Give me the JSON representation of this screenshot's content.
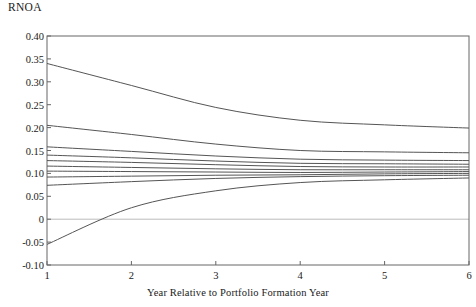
{
  "chart_data": {
    "type": "line",
    "title": "",
    "ylabel": "RNOA",
    "xlabel": "Year Relative to Portfolio Formation Year",
    "x": [
      1,
      2,
      3,
      4,
      5,
      6
    ],
    "xlim": [
      1,
      6
    ],
    "ylim": [
      -0.1,
      0.4
    ],
    "ytick_labels": [
      "0.40",
      "0.35",
      "0.30",
      "0.25",
      "0.20",
      "0.15",
      "0.10",
      "0.05",
      "0",
      "-0.05",
      "-0.10"
    ],
    "ytick_values": [
      0.4,
      0.35,
      0.3,
      0.25,
      0.2,
      0.15,
      0.1,
      0.05,
      0,
      -0.05,
      -0.1
    ],
    "xtick_labels": [
      "1",
      "2",
      "3",
      "4",
      "5",
      "6"
    ],
    "xtick_values": [
      1,
      2,
      3,
      4,
      5,
      6
    ],
    "grid": false,
    "zero_line": true,
    "legend": "none",
    "line_color": "#555555",
    "zero_line_color": "#bbbbbb",
    "axis_color": "#666666",
    "series": [
      {
        "name": "portfolio-10",
        "values": [
          0.34,
          0.292,
          0.244,
          0.216,
          0.206,
          0.199
        ]
      },
      {
        "name": "portfolio-9",
        "values": [
          0.205,
          0.185,
          0.164,
          0.15,
          0.147,
          0.145
        ]
      },
      {
        "name": "portfolio-8",
        "values": [
          0.158,
          0.148,
          0.138,
          0.131,
          0.129,
          0.128
        ]
      },
      {
        "name": "portfolio-7",
        "values": [
          0.14,
          0.134,
          0.127,
          0.122,
          0.121,
          0.12
        ]
      },
      {
        "name": "portfolio-6",
        "values": [
          0.128,
          0.124,
          0.119,
          0.115,
          0.114,
          0.114
        ]
      },
      {
        "name": "portfolio-5",
        "values": [
          0.116,
          0.113,
          0.11,
          0.108,
          0.108,
          0.108
        ]
      },
      {
        "name": "portfolio-4",
        "values": [
          0.105,
          0.104,
          0.103,
          0.102,
          0.103,
          0.104
        ]
      },
      {
        "name": "portfolio-3",
        "values": [
          0.092,
          0.094,
          0.096,
          0.097,
          0.099,
          0.1
        ]
      },
      {
        "name": "portfolio-2",
        "values": [
          0.074,
          0.082,
          0.089,
          0.093,
          0.095,
          0.096
        ]
      },
      {
        "name": "portfolio-1",
        "values": [
          -0.055,
          0.025,
          0.062,
          0.08,
          0.086,
          0.09
        ]
      }
    ]
  }
}
